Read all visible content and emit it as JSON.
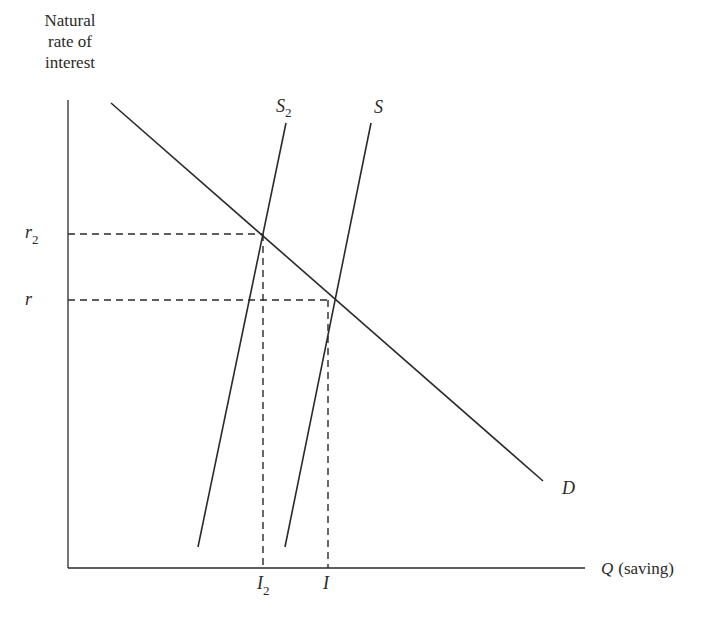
{
  "diagram": {
    "title": "",
    "y_axis_label_lines": [
      "Natural",
      "rate of",
      "interest"
    ],
    "x_axis_label": {
      "var": "Q",
      "text": "(saving)"
    },
    "curves": [
      {
        "id": "D",
        "label": "D",
        "type": "demand"
      },
      {
        "id": "S",
        "label": "S",
        "type": "supply"
      },
      {
        "id": "S2",
        "label": "S",
        "subscript": "2",
        "type": "supply"
      }
    ],
    "y_markers": [
      {
        "label": "r",
        "subscript": "2"
      },
      {
        "label": "r",
        "subscript": ""
      }
    ],
    "x_markers": [
      {
        "label": "I",
        "subscript": "2"
      },
      {
        "label": "I",
        "subscript": ""
      }
    ],
    "colors": {
      "line": "#2a2a2a",
      "background": "#ffffff"
    }
  }
}
